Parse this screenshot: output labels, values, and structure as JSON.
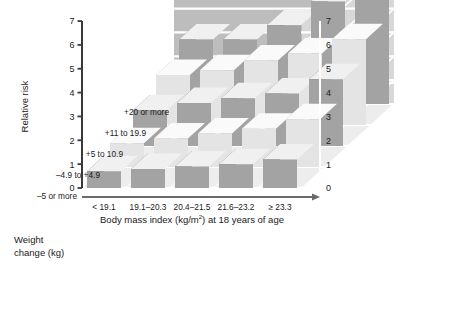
{
  "chart_data": {
    "type": "bar",
    "subtype": "3d-grouped-bar",
    "title": "",
    "xlabel": "Body mass index (kg/m2) at 18 years of age",
    "ylabel": "Relative risk",
    "zlabel": "Weight change (kg)",
    "ylim": [
      0,
      7
    ],
    "yticks": [
      0,
      1,
      2,
      3,
      4,
      5,
      6,
      7
    ],
    "right_axis_ticks": [
      0,
      1,
      2,
      3,
      4,
      5,
      6,
      7
    ],
    "grid": true,
    "legend": "none",
    "categories": [
      "< 19.1",
      "19.1-20.3",
      "20.4-21.5",
      "21.6-23.2",
      "≥ 23.3"
    ],
    "series": [
      {
        "name": "+20 or more",
        "values": [
          2.7,
          2.7,
          3.3,
          4.3,
          5.1
        ]
      },
      {
        "name": "+11 to 19.9",
        "values": [
          2.1,
          2.3,
          2.7,
          3.0,
          3.6
        ]
      },
      {
        "name": "+5 to 10.9",
        "values": [
          1.5,
          1.8,
          2.0,
          2.2,
          2.8
        ]
      },
      {
        "name": "-4.9 to +4.9",
        "values": [
          1.0,
          1.2,
          1.4,
          1.6,
          2.0
        ]
      },
      {
        "name": "-5 or more",
        "values": [
          0.7,
          0.8,
          0.9,
          1.0,
          1.2
        ]
      }
    ],
    "colors": {
      "bar_dark_front": "#a3a3a3",
      "bar_dark_top": "#f0f0f0",
      "bar_dark_side": "#6e6e6e",
      "bar_light_front": "#e4e4e4",
      "bar_light_top": "#fafafa",
      "bar_light_side": "#b4b4b4",
      "wall_back": "#bdbdbd",
      "wall_right": "#d8d8d8",
      "floor": "#ededed",
      "grid_line": "#ffffff",
      "text": "#1a1a1a"
    }
  },
  "axes": {
    "y_title": "Relative risk",
    "y_ticks": [
      "7",
      "6",
      "5",
      "4",
      "3",
      "2",
      "1",
      "0"
    ],
    "right_ticks": [
      "7",
      "6",
      "5",
      "4",
      "3",
      "2",
      "1",
      "0"
    ],
    "x_title_main": "Body mass index (kg/m",
    "x_title_sup": "2",
    "x_title_tail": ") at 18 years of age",
    "x_tick_labels": [
      "< 19.1",
      "19.1–20.3",
      "20.4–21.5",
      "21.6–23.2",
      "≥ 23.3"
    ],
    "z_title_line1": "Weight",
    "z_title_line2": "change (kg)",
    "z_tick_labels": [
      "+20 or more",
      "+11 to 19.9",
      "+5 to 10.9",
      "–4.9 to +4.9",
      "–5 or more"
    ]
  }
}
